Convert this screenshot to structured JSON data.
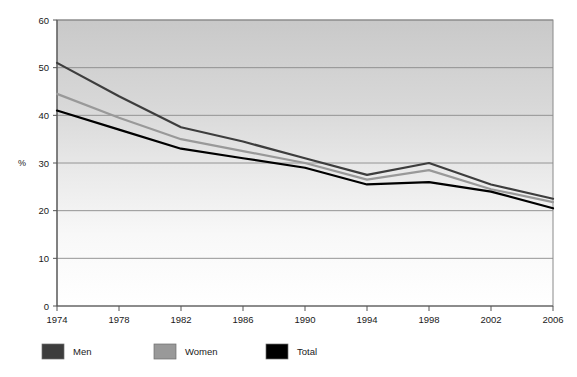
{
  "chart_data": {
    "type": "line",
    "title": "",
    "xlabel": "",
    "ylabel": "%",
    "x": [
      1974,
      1978,
      1982,
      1986,
      1990,
      1994,
      1998,
      2002,
      2006
    ],
    "categories": [
      "1974",
      "1978",
      "1982",
      "1986",
      "1990",
      "1994",
      "1998",
      "2002",
      "2006"
    ],
    "xlim": [
      1974,
      2006
    ],
    "ylim": [
      0,
      60
    ],
    "yticks": [
      0,
      10,
      20,
      30,
      40,
      50,
      60
    ],
    "ytick_labels": [
      "0",
      "10",
      "20",
      "30",
      "40",
      "50",
      "60"
    ],
    "grid": true,
    "grid_axis": "y",
    "legend_position": "bottom-left",
    "series": [
      {
        "name": "Men",
        "color": "#3d3d3d",
        "values": [
          51.0,
          44.0,
          37.5,
          34.5,
          31.0,
          27.5,
          30.0,
          25.5,
          22.5
        ]
      },
      {
        "name": "Women",
        "color": "#999999",
        "values": [
          44.5,
          39.5,
          35.0,
          32.5,
          30.0,
          26.5,
          28.5,
          24.5,
          21.8
        ]
      },
      {
        "name": "Total",
        "color": "#000000",
        "values": [
          41.0,
          37.0,
          33.0,
          31.0,
          29.0,
          25.5,
          26.0,
          24.0,
          20.5
        ]
      }
    ]
  },
  "legend": {
    "items": [
      {
        "label": "Men",
        "color": "#3d3d3d"
      },
      {
        "label": "Women",
        "color": "#999999"
      },
      {
        "label": "Total",
        "color": "#000000"
      }
    ]
  },
  "plot": {
    "background_top_color": "#c9c9c9",
    "background_bottom_color": "#ffffff",
    "border_color": "#808080",
    "gridline_color": "#8a8a8a",
    "axis_color": "#555555"
  }
}
